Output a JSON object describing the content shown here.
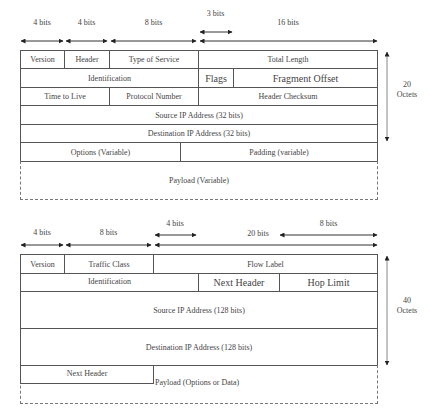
{
  "ipv4": {
    "bit_labels": [
      "4 bits",
      "4 bits",
      "8 bits",
      "3 bits",
      "16 bits"
    ],
    "rows": [
      [
        "Version",
        "Header",
        "Type of Service",
        "Total Length"
      ],
      [
        "Identification",
        "Flags",
        "Fragment Offset"
      ],
      [
        "Time to Live",
        "Protocol Number",
        "Header Checksum"
      ],
      [
        "Source IP Address (32 bits)"
      ],
      [
        "Destination IP Address (32 bits)"
      ],
      [
        "Options (Variable)",
        "Padding (variable)"
      ]
    ],
    "payload": "Payload (Variable)",
    "size_value": "20",
    "size_unit": "Octets"
  },
  "ipv6": {
    "bit_labels": [
      "4 bits",
      "8 bits",
      "4 bits",
      "20 bits",
      "8 bits"
    ],
    "rows": [
      [
        "Version",
        "Traffic Class",
        "Flow Label"
      ],
      [
        "Identification",
        "Next Header",
        "Hop Limit"
      ],
      [
        "Source IP Address (128 bits)"
      ],
      [
        "Destination IP Address (128 bits)"
      ]
    ],
    "next_header": "Next Header",
    "payload": "Payload (Options or Data)",
    "size_value": "40",
    "size_unit": "Octets"
  },
  "colors": {
    "line": "#555555",
    "arrow": "#222222",
    "text": "#444444"
  }
}
